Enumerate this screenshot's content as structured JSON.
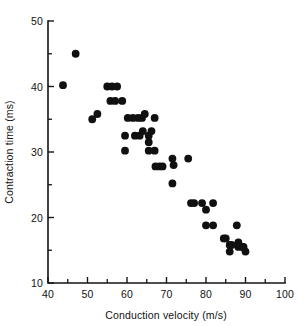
{
  "chart_data": {
    "type": "scatter",
    "title": "",
    "xlabel": "Conduction velocity (m/s)",
    "ylabel": "Contraction time (ms)",
    "xlim": [
      40,
      100
    ],
    "ylim": [
      10,
      50
    ],
    "xticks": [
      40,
      50,
      60,
      70,
      80,
      90,
      100
    ],
    "xtick_labels": [
      "40",
      "50",
      "60",
      "70",
      "80",
      "90",
      "100"
    ],
    "xticks_minor": [
      45,
      55,
      65,
      75,
      85,
      95
    ],
    "yticks": [
      10,
      20,
      30,
      40,
      50
    ],
    "ytick_labels": [
      "10",
      "20",
      "30",
      "40",
      "50"
    ],
    "yticks_minor": [
      15,
      25,
      35,
      45
    ],
    "grid": false,
    "legend": null,
    "marker": "filled-circle",
    "marker_color": "#101010",
    "marker_size_px": 5.2,
    "n_points": 51,
    "points": [
      {
        "x": 43.8,
        "y": 40.2
      },
      {
        "x": 47.0,
        "y": 45.0
      },
      {
        "x": 51.2,
        "y": 35.0
      },
      {
        "x": 52.5,
        "y": 35.8
      },
      {
        "x": 55.0,
        "y": 40.0
      },
      {
        "x": 56.2,
        "y": 40.0
      },
      {
        "x": 57.5,
        "y": 40.0
      },
      {
        "x": 55.8,
        "y": 37.8
      },
      {
        "x": 58.8,
        "y": 37.8
      },
      {
        "x": 59.5,
        "y": 32.5
      },
      {
        "x": 59.5,
        "y": 30.2
      },
      {
        "x": 60.2,
        "y": 35.2
      },
      {
        "x": 61.5,
        "y": 35.2
      },
      {
        "x": 62.8,
        "y": 35.2
      },
      {
        "x": 62.0,
        "y": 32.5
      },
      {
        "x": 63.8,
        "y": 35.2
      },
      {
        "x": 64.5,
        "y": 35.8
      },
      {
        "x": 64.0,
        "y": 33.2
      },
      {
        "x": 65.5,
        "y": 32.5
      },
      {
        "x": 65.5,
        "y": 31.5
      },
      {
        "x": 65.5,
        "y": 30.2
      },
      {
        "x": 67.0,
        "y": 35.2
      },
      {
        "x": 67.0,
        "y": 30.2
      },
      {
        "x": 67.2,
        "y": 27.8
      },
      {
        "x": 68.2,
        "y": 27.8
      },
      {
        "x": 71.5,
        "y": 29.0
      },
      {
        "x": 71.8,
        "y": 28.0
      },
      {
        "x": 71.5,
        "y": 25.2
      },
      {
        "x": 75.5,
        "y": 29.0
      },
      {
        "x": 76.2,
        "y": 22.2
      },
      {
        "x": 77.0,
        "y": 22.2
      },
      {
        "x": 79.0,
        "y": 22.2
      },
      {
        "x": 80.0,
        "y": 21.2
      },
      {
        "x": 80.0,
        "y": 18.8
      },
      {
        "x": 81.8,
        "y": 18.8
      },
      {
        "x": 81.8,
        "y": 22.2
      },
      {
        "x": 85.0,
        "y": 16.8
      },
      {
        "x": 86.0,
        "y": 15.8
      },
      {
        "x": 86.0,
        "y": 14.8
      },
      {
        "x": 87.8,
        "y": 18.8
      },
      {
        "x": 88.2,
        "y": 16.2
      },
      {
        "x": 88.2,
        "y": 15.5
      },
      {
        "x": 89.2,
        "y": 15.5
      },
      {
        "x": 90.0,
        "y": 14.8
      },
      {
        "x": 69.0,
        "y": 27.8
      },
      {
        "x": 66.2,
        "y": 33.2
      },
      {
        "x": 63.2,
        "y": 32.5
      },
      {
        "x": 57.0,
        "y": 37.8
      },
      {
        "x": 84.5,
        "y": 16.8
      },
      {
        "x": 86.5,
        "y": 15.8
      },
      {
        "x": 89.5,
        "y": 15.5
      }
    ]
  }
}
